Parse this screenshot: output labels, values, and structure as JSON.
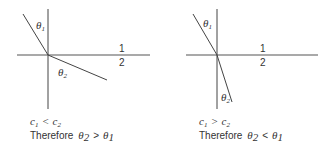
{
  "diagrams": [
    {
      "id": "left",
      "theta1_label": "θ",
      "theta1_sub": "1",
      "theta2_label": "θ",
      "theta2_sub": "2",
      "medium_top": "1",
      "medium_bottom": "2",
      "condition": {
        "lhs": "c",
        "lhs_sub": "1",
        "op": "<",
        "rhs": "c",
        "rhs_sub": "2"
      },
      "conclusion": {
        "prefix": "Therefore",
        "lhs": "θ",
        "lhs_sub": "2",
        "op": ">",
        "rhs": "θ",
        "rhs_sub": "1"
      }
    },
    {
      "id": "right",
      "theta1_label": "θ",
      "theta1_sub": "1",
      "theta2_label": "θ",
      "theta2_sub": "2",
      "medium_top": "1",
      "medium_bottom": "2",
      "condition": {
        "lhs": "c",
        "lhs_sub": "1",
        "op": ">",
        "rhs": "c",
        "rhs_sub": "2"
      },
      "conclusion": {
        "prefix": "Therefore",
        "lhs": "θ",
        "lhs_sub": "2",
        "op": "<",
        "rhs": "θ",
        "rhs_sub": "1"
      }
    }
  ],
  "colors": {
    "line": "#444444",
    "text": "#333333",
    "background": "#ffffff"
  }
}
